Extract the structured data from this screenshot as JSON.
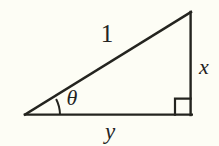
{
  "figure": {
    "type": "geometry-diagram",
    "background_color": "#fdfdf5",
    "stroke_color": "#24241f",
    "label_color": "#24241f",
    "width": 219,
    "height": 146,
    "vertices": {
      "left": {
        "x": 25,
        "y": 115
      },
      "apex": {
        "x": 191,
        "y": 12
      },
      "right_angle": {
        "x": 191,
        "y": 115
      }
    },
    "sides": [
      {
        "name": "hypotenuse",
        "label": "1",
        "style": "upright",
        "from": "left",
        "to": "apex"
      },
      {
        "name": "opposite-leg",
        "label": "x",
        "style": "italic",
        "from": "apex",
        "to": "right_angle"
      },
      {
        "name": "adjacent-leg",
        "label": "y",
        "style": "italic",
        "from": "left",
        "to": "right_angle"
      }
    ],
    "angles": [
      {
        "name": "theta",
        "label": "θ",
        "style": "italic",
        "at": "left",
        "marker": "arc"
      },
      {
        "name": "right-angle",
        "label": "",
        "at": "right_angle",
        "marker": "square"
      }
    ],
    "labels": {
      "hypotenuse": "1",
      "vertical_leg": "x",
      "horizontal_leg": "y",
      "angle": "θ"
    },
    "label_positions": {
      "hypotenuse": {
        "x": 107,
        "y": 42
      },
      "vertical_leg": {
        "x": 204,
        "y": 74
      },
      "horizontal_leg": {
        "x": 110,
        "y": 138
      },
      "angle": {
        "x": 72,
        "y": 104
      }
    },
    "right_angle_marker": {
      "size": 16
    },
    "angle_arc": {
      "radius": 35
    }
  }
}
